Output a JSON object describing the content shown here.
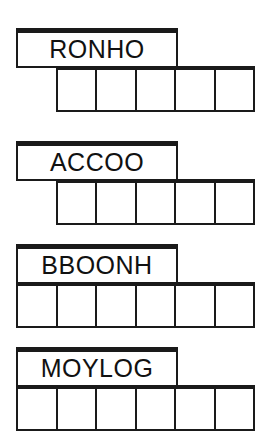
{
  "sheet": {
    "title": "Word scramble answer grid worksheet",
    "ink_color": "#1a1a1a",
    "paper_color": "#ffffff"
  },
  "blocks": [
    {
      "id": "block-1",
      "word": "RONHO",
      "cell_count": 5,
      "row_alignment": "offset-right",
      "circled_cells": [
        1,
        4
      ],
      "cells": [
        {
          "index": 1,
          "letter": "",
          "circled": true
        },
        {
          "index": 2,
          "letter": "",
          "circled": false
        },
        {
          "index": 3,
          "letter": "",
          "circled": false
        },
        {
          "index": 4,
          "letter": "",
          "circled": true
        },
        {
          "index": 5,
          "letter": "",
          "circled": false
        }
      ]
    },
    {
      "id": "block-2",
      "word": "ACCOO",
      "cell_count": 5,
      "row_alignment": "offset-right",
      "circled_cells": [
        2
      ],
      "cells": [
        {
          "index": 1,
          "letter": "",
          "circled": false
        },
        {
          "index": 2,
          "letter": "",
          "circled": true
        },
        {
          "index": 3,
          "letter": "",
          "circled": false
        },
        {
          "index": 4,
          "letter": "",
          "circled": false
        },
        {
          "index": 5,
          "letter": "",
          "circled": false
        }
      ]
    },
    {
      "id": "block-3",
      "word": "BBOONH",
      "cell_count": 6,
      "row_alignment": "left-aligned",
      "circled_cells": [
        5,
        6
      ],
      "cells": [
        {
          "index": 1,
          "letter": "",
          "circled": false
        },
        {
          "index": 2,
          "letter": "",
          "circled": false
        },
        {
          "index": 3,
          "letter": "",
          "circled": false
        },
        {
          "index": 4,
          "letter": "",
          "circled": false
        },
        {
          "index": 5,
          "letter": "",
          "circled": true
        },
        {
          "index": 6,
          "letter": "",
          "circled": true
        }
      ]
    },
    {
      "id": "block-4",
      "word": "MOYLOG",
      "cell_count": 6,
      "row_alignment": "left-aligned",
      "circled_cells": [
        4
      ],
      "cells": [
        {
          "index": 1,
          "letter": "",
          "circled": false
        },
        {
          "index": 2,
          "letter": "",
          "circled": false
        },
        {
          "index": 3,
          "letter": "",
          "circled": false
        },
        {
          "index": 4,
          "letter": "",
          "circled": true
        },
        {
          "index": 5,
          "letter": "",
          "circled": false
        },
        {
          "index": 6,
          "letter": "",
          "circled": false
        }
      ]
    }
  ],
  "layout": {
    "word_box": {
      "left": 16,
      "width": 162,
      "height": 40
    },
    "row_offset_right": {
      "left": 56,
      "width": 199
    },
    "row_left_aligned": {
      "left": 16,
      "width": 239
    },
    "row_height": 46,
    "block_tops": [
      28,
      141,
      244,
      347
    ]
  }
}
